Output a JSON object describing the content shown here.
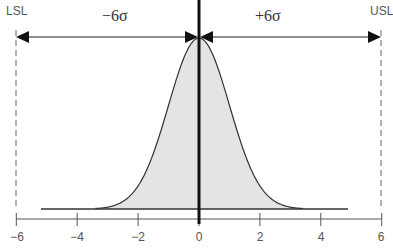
{
  "chart_data": {
    "type": "area",
    "title": "",
    "xlabel": "",
    "ylabel": "",
    "xlim": [
      -6,
      6
    ],
    "x_ticks": [
      -6,
      -4,
      -2,
      0,
      2,
      4,
      6
    ],
    "x_tick_labels": [
      "−6",
      "−4",
      "−2",
      "0",
      "2",
      "4",
      "6"
    ],
    "grid": false,
    "series": [
      {
        "name": "normal-distribution",
        "mean": 0,
        "sigma": 1,
        "fill": "#e4e4e4",
        "stroke": "#333333"
      }
    ],
    "baseline": {
      "x_start": -5.2,
      "x_end": 4.9
    },
    "annotations": [
      {
        "type": "spec-limit",
        "label": "LSL",
        "x": -6,
        "style": "dashed"
      },
      {
        "type": "spec-limit",
        "label": "USL",
        "x": 6,
        "style": "dashed"
      },
      {
        "type": "center-line",
        "x": 0
      },
      {
        "type": "double-arrow",
        "label": "−6σ",
        "from": -6,
        "to": 0
      },
      {
        "type": "double-arrow",
        "label": "+6σ",
        "from": 0,
        "to": 6
      }
    ]
  },
  "labels": {
    "lsl": "LSL",
    "usl": "USL",
    "minus_six_sigma": "−6σ",
    "plus_six_sigma": "+6σ"
  },
  "ticks": [
    "−6",
    "−4",
    "−2",
    "0",
    "2",
    "4",
    "6"
  ],
  "colors": {
    "fill": "#e4e4e4",
    "stroke": "#333333",
    "axis": "#555555",
    "center": "#111111"
  }
}
